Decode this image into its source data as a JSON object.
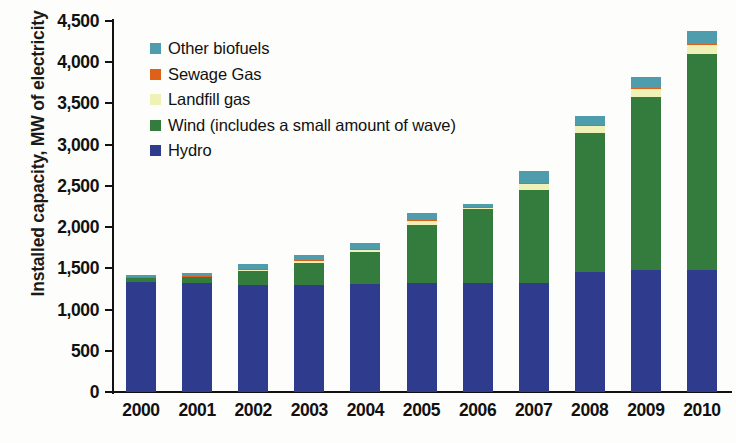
{
  "chart_data": {
    "type": "bar",
    "subtype": "stacked-vertical",
    "title": "",
    "xlabel": "",
    "ylabel": "Installed capacity, MW of electricity",
    "ylim": [
      0,
      4500
    ],
    "ytick_step": 500,
    "ytick_labels": [
      "0",
      "500",
      "1,000",
      "1,500",
      "2,000",
      "2,500",
      "3,000",
      "3,500",
      "4,000",
      "4,500"
    ],
    "ytick_values": [
      0,
      500,
      1000,
      1500,
      2000,
      2500,
      3000,
      3500,
      4000,
      4500
    ],
    "grid": false,
    "legend_position": "top-left-inside",
    "categories": [
      "2000",
      "2001",
      "2002",
      "2003",
      "2004",
      "2005",
      "2006",
      "2007",
      "2008",
      "2009",
      "2010"
    ],
    "series": [
      {
        "name": "Hydro",
        "color": "#2f3c8e",
        "values": [
          1330,
          1325,
          1300,
          1300,
          1315,
          1320,
          1325,
          1325,
          1460,
          1480,
          1480
        ]
      },
      {
        "name": "Wind (includes a small amount of wave)",
        "color": "#347c3e",
        "values": [
          50,
          65,
          170,
          270,
          380,
          710,
          900,
          1130,
          1680,
          2100,
          2625
        ]
      },
      {
        "name": "Landfill gas",
        "color": "#eff1b6",
        "values": [
          10,
          15,
          20,
          25,
          35,
          50,
          20,
          70,
          95,
          105,
          110
        ]
      },
      {
        "name": "Sewage Gas",
        "color": "#e0601a",
        "values": [
          5,
          5,
          5,
          5,
          5,
          5,
          5,
          5,
          5,
          5,
          5
        ]
      },
      {
        "name": "Other biofuels",
        "color": "#4f9cac",
        "values": [
          30,
          35,
          55,
          60,
          75,
          85,
          35,
          145,
          110,
          135,
          155
        ]
      }
    ],
    "stack_order_bottom_to_top": [
      "Hydro",
      "Wind (includes a small amount of wave)",
      "Landfill gas",
      "Sewage Gas",
      "Other biofuels"
    ],
    "totals": [
      1425,
      1445,
      1550,
      1660,
      1810,
      2170,
      2285,
      2675,
      3350,
      3825,
      4375
    ]
  },
  "legend": {
    "entries": [
      {
        "label": "Other biofuels",
        "color": "#4f9cac"
      },
      {
        "label": "Sewage Gas",
        "color": "#e0601a"
      },
      {
        "label": "Landfill gas",
        "color": "#eff1b6"
      },
      {
        "label": "Wind (includes a small amount of wave)",
        "color": "#347c3e"
      },
      {
        "label": "Hydro",
        "color": "#2f3c8e"
      }
    ]
  }
}
